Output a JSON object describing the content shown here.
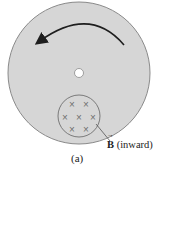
{
  "diagram": {
    "caption": "(a)",
    "field_label_symbol": "B",
    "field_label_text": " (inward)",
    "field_marker": "×",
    "field_marker_count": 7,
    "rotation_direction": "counterclockwise",
    "colors": {
      "disk_fill": "#d6d6d6",
      "disk_stroke": "#8a8a8a",
      "arrow": "#1e1e1e",
      "field_region_stroke": "#7a7a7a",
      "marker": "#707070"
    }
  }
}
